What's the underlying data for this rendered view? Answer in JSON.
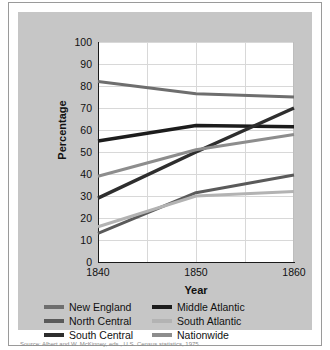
{
  "figure": {
    "background_color": "#c6c6c6",
    "plot_background_color": "#ffffff",
    "caption": "Source: Albert and W. McKinney, eds., U.S. Census statistics, 1975."
  },
  "axes": {
    "ylabel": "Percentage",
    "xlabel": "Year",
    "ytick_labels": [
      "100",
      "90",
      "80",
      "70",
      "60",
      "50",
      "40",
      "30",
      "20",
      "10",
      "0"
    ],
    "xtick_labels": [
      "1840",
      "1850",
      "1860"
    ]
  },
  "legend": {
    "items": [
      {
        "label": "New England",
        "color": "#6e6e6e"
      },
      {
        "label": "Middle Atlantic",
        "color": "#1c1c1c"
      },
      {
        "label": "North Central",
        "color": "#5a5a5a"
      },
      {
        "label": "South Atlantic",
        "color": "#b3b3b3"
      },
      {
        "label": "South Central",
        "color": "#2e2e2e"
      },
      {
        "label": "Nationwide",
        "color": "#8d8d8d"
      }
    ]
  },
  "chart_data": {
    "type": "line",
    "title": "",
    "xlabel": "Year",
    "ylabel": "Percentage",
    "x": [
      1840,
      1850,
      1860
    ],
    "xlim": [
      1840,
      1860
    ],
    "ylim": [
      0,
      100
    ],
    "ytick_values": [
      0,
      10,
      20,
      30,
      40,
      50,
      60,
      70,
      80,
      90,
      100
    ],
    "xtick_values": [
      1840,
      1850,
      1860
    ],
    "grid": true,
    "legend_position": "below",
    "series": [
      {
        "name": "New England",
        "values": [
          82,
          76.5,
          75
        ],
        "color": "#6e6e6e",
        "width": 3
      },
      {
        "name": "Middle Atlantic",
        "values": [
          55,
          62,
          61.5
        ],
        "color": "#1c1c1c",
        "width": 3.5
      },
      {
        "name": "North Central",
        "values": [
          13,
          31.5,
          39.5
        ],
        "color": "#5a5a5a",
        "width": 3
      },
      {
        "name": "South Atlantic",
        "values": [
          16,
          30,
          32
        ],
        "color": "#b3b3b3",
        "width": 3
      },
      {
        "name": "South Central",
        "values": [
          29,
          50,
          70
        ],
        "color": "#2e2e2e",
        "width": 3.5
      },
      {
        "name": "Nationwide",
        "values": [
          39,
          51,
          58
        ],
        "color": "#8d8d8d",
        "width": 3
      }
    ]
  }
}
